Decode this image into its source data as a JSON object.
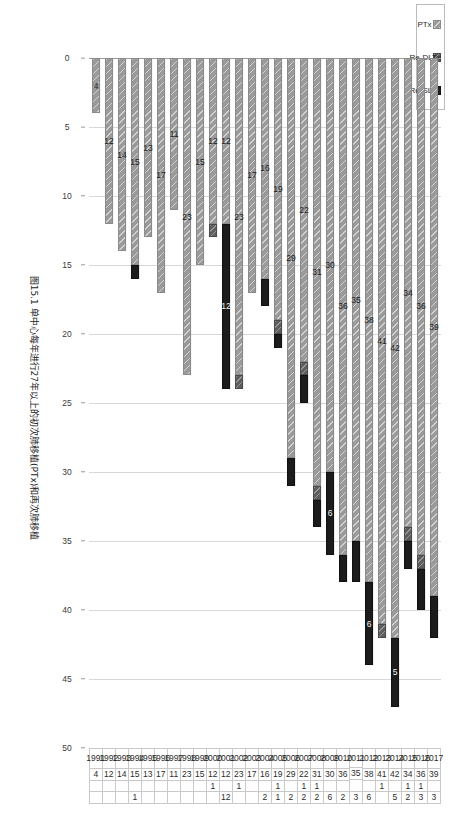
{
  "caption": {
    "text": "图15.1  单中心每年进行27年以上的初次肺移植(PTx)和再次肺移植"
  },
  "legend": {
    "position": "bottom-left",
    "items": [
      {
        "key": "ptx",
        "label": "PTx",
        "color": "#9a9a9a",
        "icon": "hatched-square-icon"
      },
      {
        "key": "dltx",
        "label": "Re-DLTx",
        "color": "#5e5e5e",
        "icon": "hatched-square-icon"
      },
      {
        "key": "sltx",
        "label": "Re-SLTx",
        "color": "#1c1c1c",
        "icon": "solid-square-icon"
      }
    ]
  },
  "chart_data": {
    "type": "bar",
    "orientation": "horizontal",
    "stacked": true,
    "title": "图15.1  单中心每年进行27年以上的初次肺移植(PTx)和再次肺移植",
    "xlabel": "",
    "ylabel": "",
    "xlim": [
      0,
      50
    ],
    "ticks": [
      0,
      5,
      10,
      15,
      20,
      25,
      30,
      35,
      40,
      45,
      50
    ],
    "grid": true,
    "categories": [
      "2017",
      "2016",
      "2015",
      "2014",
      "2013",
      "2012",
      "2011",
      "2010",
      "2009",
      "2008",
      "2007",
      "2006",
      "2005",
      "2004",
      "2003",
      "2002",
      "2001",
      "2000",
      "1999",
      "1998",
      "1997",
      "1996",
      "1995",
      "1994",
      "1993",
      "1992",
      "1991"
    ],
    "series": [
      {
        "name": "PTx",
        "values": [
          39,
          36,
          34,
          42,
          41,
          38,
          35,
          36,
          30,
          31,
          22,
          29,
          19,
          16,
          17,
          23,
          12,
          12,
          15,
          23,
          11,
          17,
          13,
          15,
          14,
          12,
          4
        ]
      },
      {
        "name": "Re-DLTx",
        "values": [
          null,
          1,
          1,
          null,
          1,
          null,
          null,
          null,
          null,
          1,
          1,
          null,
          1,
          null,
          null,
          1,
          null,
          1,
          null,
          null,
          null,
          null,
          null,
          null,
          null,
          null,
          null
        ]
      },
      {
        "name": "Re-SLTx",
        "values": [
          3,
          3,
          2,
          5,
          null,
          6,
          3,
          2,
          6,
          2,
          2,
          2,
          1,
          2,
          null,
          null,
          12,
          null,
          null,
          null,
          null,
          null,
          null,
          1,
          null,
          null,
          null
        ]
      }
    ]
  },
  "table": {
    "columns": [
      "year",
      "PTx",
      "Re-DLTx",
      "Re-SLTx"
    ],
    "rows": [
      {
        "year": "2017",
        "ptx": "39",
        "dltx": "",
        "sltx": "3"
      },
      {
        "year": "2016",
        "ptx": "36",
        "dltx": "1",
        "sltx": "3"
      },
      {
        "year": "2015",
        "ptx": "34",
        "dltx": "1",
        "sltx": "2"
      },
      {
        "year": "2014",
        "ptx": "42",
        "dltx": "",
        "sltx": "5"
      },
      {
        "year": "2013",
        "ptx": "41",
        "dltx": "1",
        "sltx": ""
      },
      {
        "year": "2012",
        "ptx": "38",
        "dltx": "",
        "sltx": "6"
      },
      {
        "year": "2011",
        "ptx": "35",
        "dltx": "",
        "sltx": "3"
      },
      {
        "year": "2010",
        "ptx": "36",
        "dltx": "",
        "sltx": "2"
      },
      {
        "year": "2009",
        "ptx": "30",
        "dltx": "",
        "sltx": "6"
      },
      {
        "year": "2008",
        "ptx": "31",
        "dltx": "1",
        "sltx": "2"
      },
      {
        "year": "2007",
        "ptx": "22",
        "dltx": "1",
        "sltx": "2"
      },
      {
        "year": "2006",
        "ptx": "29",
        "dltx": "",
        "sltx": "2"
      },
      {
        "year": "2005",
        "ptx": "19",
        "dltx": "1",
        "sltx": "1"
      },
      {
        "year": "2004",
        "ptx": "16",
        "dltx": "",
        "sltx": "2"
      },
      {
        "year": "2003",
        "ptx": "17",
        "dltx": "",
        "sltx": ""
      },
      {
        "year": "2002",
        "ptx": "23",
        "dltx": "1",
        "sltx": ""
      },
      {
        "year": "2001",
        "ptx": "12",
        "dltx": "",
        "sltx": "12"
      },
      {
        "year": "2000",
        "ptx": "12",
        "dltx": "1",
        "sltx": ""
      },
      {
        "year": "1999",
        "ptx": "15",
        "dltx": "",
        "sltx": ""
      },
      {
        "year": "1998",
        "ptx": "23",
        "dltx": "",
        "sltx": ""
      },
      {
        "year": "1997",
        "ptx": "11",
        "dltx": "",
        "sltx": ""
      },
      {
        "year": "1996",
        "ptx": "17",
        "dltx": "",
        "sltx": ""
      },
      {
        "year": "1995",
        "ptx": "13",
        "dltx": "",
        "sltx": ""
      },
      {
        "year": "1994",
        "ptx": "15",
        "dltx": "",
        "sltx": "1"
      },
      {
        "year": "1993",
        "ptx": "14",
        "dltx": "",
        "sltx": ""
      },
      {
        "year": "1992",
        "ptx": "12",
        "dltx": "",
        "sltx": ""
      },
      {
        "year": "1991",
        "ptx": "4",
        "dltx": "",
        "sltx": ""
      }
    ]
  },
  "axis": {
    "ticks": [
      "50",
      "45",
      "40",
      "35",
      "30",
      "25",
      "20",
      "15",
      "10",
      "5",
      "0"
    ]
  }
}
